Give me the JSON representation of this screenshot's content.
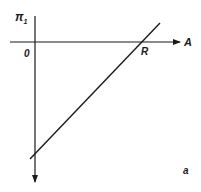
{
  "diagram": {
    "vertical_axis_label": "π",
    "vertical_axis_subscript": "1",
    "horizontal_axis_label": "A",
    "origin_label": "0",
    "intercept_label": "R",
    "panel_label": "a",
    "colors": {
      "ink": "#1a1a1a",
      "background": "#ffffff"
    }
  }
}
